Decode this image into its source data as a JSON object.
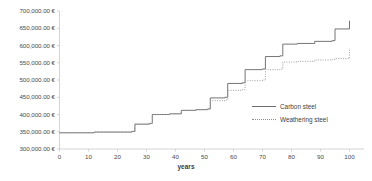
{
  "chart_data": {
    "type": "line",
    "title": "",
    "subtitle": "",
    "xlabel": "years",
    "ylabel": "",
    "xlim": [
      0,
      105
    ],
    "ylim": [
      300000,
      700000
    ],
    "grid": false,
    "legend_position": "inside-right",
    "x_ticks": [
      0,
      10,
      20,
      30,
      40,
      50,
      60,
      70,
      80,
      90,
      100
    ],
    "x_tick_labels": [
      "0",
      "10",
      "20",
      "30",
      "40",
      "50",
      "60",
      "70",
      "80",
      "90",
      "100"
    ],
    "y_ticks": [
      300000,
      350000,
      400000,
      450000,
      500000,
      550000,
      600000,
      650000,
      700000
    ],
    "y_tick_labels": [
      "300,000.00 €",
      "350,000.00 €",
      "400,000.00 €",
      "450,000.00 €",
      "500,000.00 €",
      "550,000.00 €",
      "600,000.00 €",
      "650,000.00 €",
      "700,000.00 €"
    ],
    "currency": "€",
    "series": [
      {
        "name": "Carbon steel",
        "style": "solid",
        "color": "#6e6e6e",
        "step": "post",
        "x": [
          0,
          12,
          25,
          26,
          31,
          32,
          38,
          42,
          47,
          51,
          52,
          57,
          58,
          63,
          64,
          70,
          71,
          76,
          77,
          82,
          88,
          94,
          95,
          100
        ],
        "y": [
          347000,
          349000,
          351000,
          372000,
          374000,
          400000,
          402000,
          412000,
          414000,
          416000,
          448000,
          450000,
          490000,
          492000,
          530000,
          532000,
          568000,
          570000,
          604000,
          606000,
          612000,
          614000,
          648000,
          672000
        ]
      },
      {
        "name": "Weathering steel",
        "style": "dotted",
        "color": "#9a9a9a",
        "step": "post",
        "x": [
          0,
          12,
          25,
          26,
          31,
          32,
          38,
          42,
          47,
          51,
          52,
          57,
          58,
          63,
          64,
          70,
          71,
          76,
          77,
          82,
          88,
          94,
          95,
          100
        ],
        "y": [
          347000,
          349000,
          351000,
          372000,
          374000,
          400000,
          402000,
          412000,
          414000,
          416000,
          440000,
          442000,
          470000,
          472000,
          498000,
          500000,
          530000,
          532000,
          552000,
          554000,
          558000,
          560000,
          562000,
          588000
        ]
      }
    ]
  },
  "legend": {
    "items": [
      {
        "label": "Carbon steel",
        "style": "solid"
      },
      {
        "label": "Weathering steel",
        "style": "dotted"
      }
    ]
  }
}
